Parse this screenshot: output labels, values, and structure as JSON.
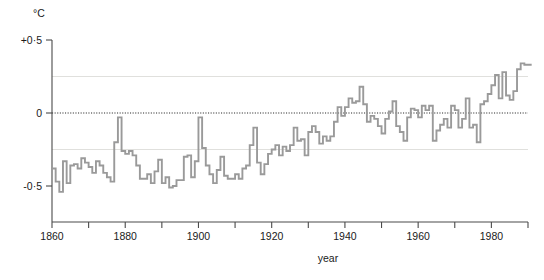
{
  "chart_data": {
    "type": "line",
    "title": "",
    "subtitle": "",
    "xlabel": "year",
    "ylabel": "",
    "unit_label": "°C",
    "xlim": [
      1860,
      1990
    ],
    "ylim": [
      -0.62,
      0.55
    ],
    "grid": true,
    "gridlines_y": [
      0.25,
      -0.25
    ],
    "zero_reference_line": 0,
    "legend": null,
    "legend_position": "none",
    "line_style": "step",
    "line_color": "#9a9a9a",
    "x_ticks_major": [
      1860,
      1880,
      1900,
      1920,
      1940,
      1960,
      1980
    ],
    "x_tick_labels": [
      "1860",
      "1880",
      "1900",
      "1920",
      "1940",
      "1960",
      "1980"
    ],
    "x_ticks_minor": [
      1870,
      1890,
      1910,
      1930,
      1950,
      1970,
      1990
    ],
    "y_ticks": [
      0.5,
      0,
      -0.5
    ],
    "y_tick_labels": [
      "+0·5",
      "0",
      "-0·5"
    ],
    "x": [
      1860,
      1861,
      1862,
      1863,
      1864,
      1865,
      1866,
      1867,
      1868,
      1869,
      1870,
      1871,
      1872,
      1873,
      1874,
      1875,
      1876,
      1877,
      1878,
      1879,
      1880,
      1881,
      1882,
      1883,
      1884,
      1885,
      1886,
      1887,
      1888,
      1889,
      1890,
      1891,
      1892,
      1893,
      1894,
      1895,
      1896,
      1897,
      1898,
      1899,
      1900,
      1901,
      1902,
      1903,
      1904,
      1905,
      1906,
      1907,
      1908,
      1909,
      1910,
      1911,
      1912,
      1913,
      1914,
      1915,
      1916,
      1917,
      1918,
      1919,
      1920,
      1921,
      1922,
      1923,
      1924,
      1925,
      1926,
      1927,
      1928,
      1929,
      1930,
      1931,
      1932,
      1933,
      1934,
      1935,
      1936,
      1937,
      1938,
      1939,
      1940,
      1941,
      1942,
      1943,
      1944,
      1945,
      1946,
      1947,
      1948,
      1949,
      1950,
      1951,
      1952,
      1953,
      1954,
      1955,
      1956,
      1957,
      1958,
      1959,
      1960,
      1961,
      1962,
      1963,
      1964,
      1965,
      1966,
      1967,
      1968,
      1969,
      1970,
      1971,
      1972,
      1973,
      1974,
      1975,
      1976,
      1977,
      1978,
      1979,
      1980,
      1981,
      1982,
      1983,
      1984,
      1985,
      1986,
      1987,
      1988,
      1989,
      1990
    ],
    "values": [
      -0.38,
      -0.47,
      -0.54,
      -0.33,
      -0.48,
      -0.36,
      -0.35,
      -0.38,
      -0.31,
      -0.34,
      -0.37,
      -0.41,
      -0.33,
      -0.36,
      -0.41,
      -0.44,
      -0.47,
      -0.2,
      -0.03,
      -0.26,
      -0.28,
      -0.26,
      -0.29,
      -0.36,
      -0.45,
      -0.45,
      -0.42,
      -0.48,
      -0.4,
      -0.32,
      -0.48,
      -0.44,
      -0.51,
      -0.5,
      -0.46,
      -0.46,
      -0.3,
      -0.29,
      -0.44,
      -0.33,
      -0.03,
      -0.24,
      -0.36,
      -0.42,
      -0.48,
      -0.39,
      -0.3,
      -0.43,
      -0.45,
      -0.45,
      -0.42,
      -0.45,
      -0.38,
      -0.36,
      -0.22,
      -0.1,
      -0.34,
      -0.42,
      -0.35,
      -0.28,
      -0.25,
      -0.22,
      -0.29,
      -0.23,
      -0.26,
      -0.22,
      -0.1,
      -0.19,
      -0.18,
      -0.29,
      -0.13,
      -0.09,
      -0.13,
      -0.21,
      -0.16,
      -0.19,
      -0.16,
      -0.06,
      0.04,
      -0.02,
      0.04,
      0.1,
      0.07,
      0.08,
      0.18,
      0.06,
      -0.06,
      -0.02,
      -0.04,
      -0.09,
      -0.14,
      -0.04,
      0.01,
      0.08,
      -0.09,
      -0.13,
      -0.19,
      -0.03,
      0.03,
      0.02,
      -0.03,
      0.05,
      0.02,
      0.05,
      -0.19,
      -0.12,
      -0.08,
      -0.04,
      -0.1,
      0.05,
      0.02,
      -0.1,
      -0.04,
      0.1,
      -0.1,
      -0.08,
      -0.2,
      0.06,
      0.08,
      0.13,
      0.19,
      0.26,
      0.1,
      0.28,
      0.12,
      0.09,
      0.15,
      0.3,
      0.34,
      0.33,
      0.33
    ]
  },
  "axis_titles": {
    "x": "year",
    "y_unit": "°C"
  }
}
